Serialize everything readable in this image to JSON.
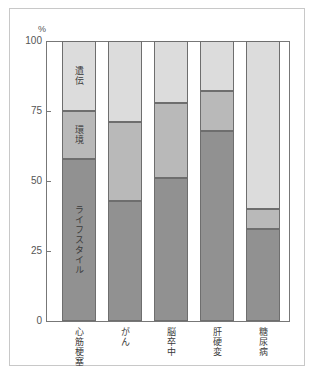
{
  "chart_data": {
    "type": "bar",
    "subtype": "stacked-percentage-column",
    "title": "",
    "xlabel": "",
    "ylabel": "%",
    "ylim": [
      0,
      100
    ],
    "yticks": [
      0,
      25,
      50,
      75,
      100
    ],
    "ytick_labels": [
      "0",
      "25",
      "50",
      "75",
      "100"
    ],
    "grid": false,
    "legend_position": "in-bar-first-column",
    "categories": [
      "心筋梗塞",
      "がん",
      "脳卒中",
      "肝硬変",
      "糖尿病"
    ],
    "series": [
      {
        "name": "ライフスタイル",
        "color": "#919191",
        "values": [
          58,
          43,
          51,
          68,
          33
        ]
      },
      {
        "name": "環境",
        "color": "#b9b9b9",
        "values": [
          17,
          28,
          27,
          14,
          7
        ]
      },
      {
        "name": "遺伝",
        "color": "#dcdcdc",
        "values": [
          25,
          29,
          22,
          18,
          60
        ]
      }
    ],
    "annotations": [
      {
        "text": "遺伝",
        "bar": 0,
        "segment": 2
      },
      {
        "text": "環境",
        "bar": 0,
        "segment": 1
      },
      {
        "text": "ライフスタイル",
        "bar": 0,
        "segment": 0
      }
    ]
  }
}
